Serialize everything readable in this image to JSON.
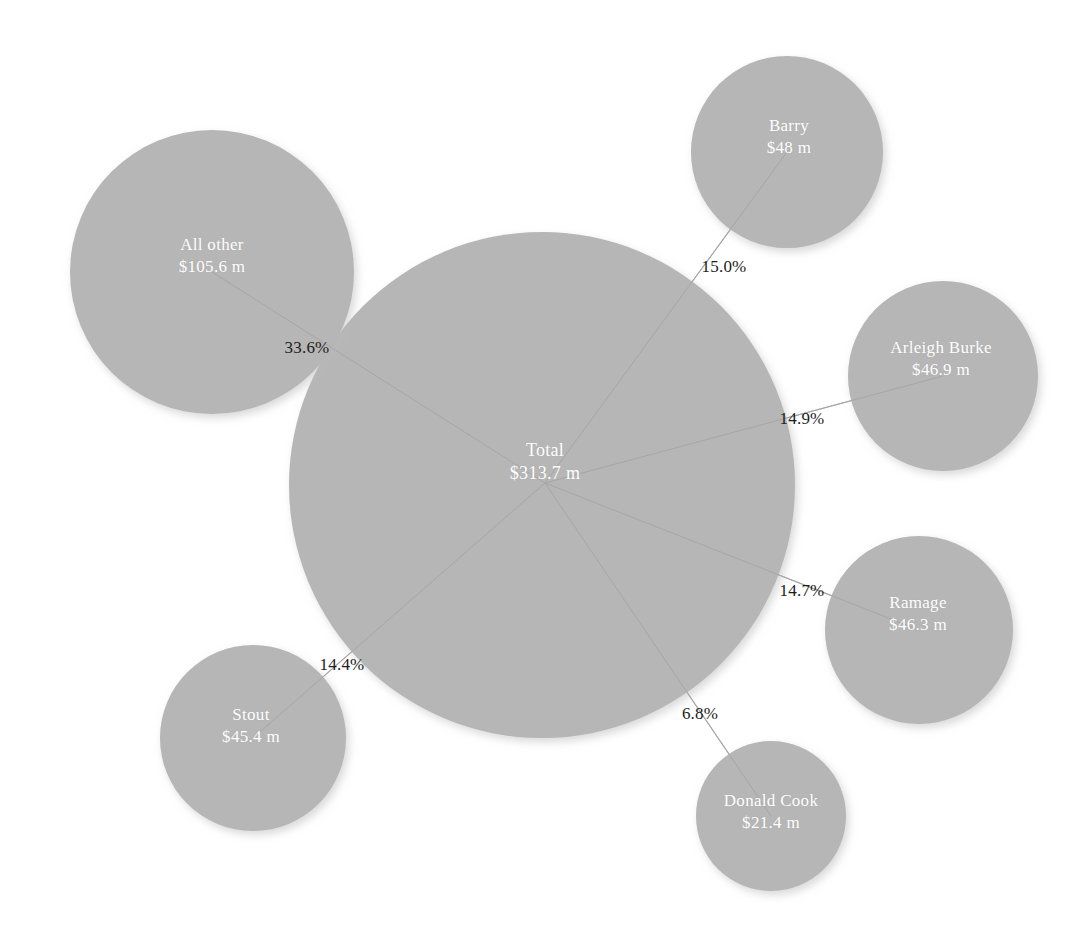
{
  "chart_data": {
    "type": "bubble",
    "title": "",
    "subtitle": "",
    "xlabel": "",
    "ylabel": "",
    "grid": false,
    "legend": "none",
    "units": "USD millions",
    "value_prefix": "$",
    "value_suffix": " m",
    "center": {
      "id": "total",
      "name": "Total",
      "value": 313.7,
      "value_label": "$313.7 m",
      "cx": 542,
      "cy": 485,
      "r": 253,
      "label_x": 545,
      "label_y": 462
    },
    "nodes": [
      {
        "id": "all-other",
        "name": "All other",
        "value": 105.6,
        "value_label": "$105.6 m",
        "share": 33.6,
        "share_label": "33.6%",
        "cx": 212,
        "cy": 272,
        "r": 142,
        "label_x": 212,
        "label_y": 256,
        "edge_label_x": 307,
        "edge_label_y": 348
      },
      {
        "id": "barry",
        "name": "Barry",
        "value": 48.0,
        "value_label": "$48 m",
        "share": 15.0,
        "share_label": "15.0%",
        "cx": 787,
        "cy": 152,
        "r": 96,
        "label_x": 789,
        "label_y": 137,
        "edge_label_x": 724,
        "edge_label_y": 267
      },
      {
        "id": "arleigh-burke",
        "name": "Arleigh Burke",
        "value": 46.9,
        "value_label": "$46.9 m",
        "share": 14.9,
        "share_label": "14.9%",
        "cx": 943,
        "cy": 376,
        "r": 95,
        "label_x": 941,
        "label_y": 359,
        "edge_label_x": 802,
        "edge_label_y": 419
      },
      {
        "id": "ramage",
        "name": "Ramage",
        "value": 46.3,
        "value_label": "$46.3 m",
        "share": 14.7,
        "share_label": "14.7%",
        "cx": 919,
        "cy": 630,
        "r": 94,
        "label_x": 918,
        "label_y": 614,
        "edge_label_x": 802,
        "edge_label_y": 591
      },
      {
        "id": "donald-cook",
        "name": "Donald Cook",
        "value": 21.4,
        "value_label": "$21.4 m",
        "share": 6.8,
        "share_label": "6.8%",
        "cx": 771,
        "cy": 816,
        "r": 75,
        "label_x": 771,
        "label_y": 812,
        "edge_label_x": 700,
        "edge_label_y": 714
      },
      {
        "id": "stout",
        "name": "Stout",
        "value": 45.4,
        "value_label": "$45.4 m",
        "share": 14.4,
        "share_label": "14.4%",
        "cx": 253,
        "cy": 738,
        "r": 93,
        "label_x": 251,
        "label_y": 726,
        "edge_label_x": 342,
        "edge_label_y": 665
      }
    ],
    "colors": {
      "bubble_fill": "#b6b6b6",
      "bubble_shadow": "#cfcfcf",
      "background": "#ffffff",
      "edge_line": "#a8a8a8",
      "node_text": "#ffffff",
      "edge_text": "#1d1d1d"
    },
    "categories": [
      "All other",
      "Barry",
      "Arleigh Burke",
      "Ramage",
      "Donald Cook",
      "Stout"
    ],
    "values": [
      105.6,
      48.0,
      46.9,
      46.3,
      21.4,
      45.4
    ],
    "shares": [
      33.6,
      15.0,
      14.9,
      14.7,
      6.8,
      14.4
    ]
  }
}
